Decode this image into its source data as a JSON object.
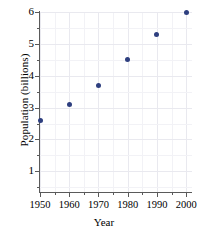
{
  "chart_data": {
    "type": "scatter",
    "title": "",
    "xlabel": "Year",
    "ylabel": "Population (billions)",
    "x": [
      1950,
      1960,
      1970,
      1980,
      1990,
      2000
    ],
    "values": [
      2.6,
      3.1,
      3.7,
      4.5,
      5.3,
      6.0
    ],
    "series": [
      {
        "name": "World population",
        "points": [
          {
            "x": 1950,
            "y": 2.6
          },
          {
            "x": 1960,
            "y": 3.1
          },
          {
            "x": 1970,
            "y": 3.7
          },
          {
            "x": 1980,
            "y": 4.5
          },
          {
            "x": 1990,
            "y": 5.3
          },
          {
            "x": 2000,
            "y": 6.0
          }
        ]
      }
    ],
    "xlim": [
      1950,
      2002
    ],
    "ylim": [
      0.35,
      6.0
    ],
    "xticks": [
      1950,
      1960,
      1970,
      1980,
      1990,
      2000
    ],
    "xtick_labels": [
      "1950",
      "1960",
      "1970",
      "1980",
      "1990",
      "2000"
    ],
    "x_minor_ticks": [
      1955,
      1965,
      1975,
      1985,
      1995
    ],
    "yticks": [
      1,
      2,
      3,
      4,
      5,
      6
    ],
    "ytick_labels": [
      "1",
      "2",
      "3",
      "4",
      "5",
      "6"
    ],
    "y_minor_ticks": [
      0.5,
      1.5,
      2.5,
      3.5,
      4.5,
      5.5
    ],
    "grid": true,
    "legend": "none",
    "marker_color": "#2e3f7f",
    "grid_color": "#e9e9ef",
    "axis_color": "#5a5a5a"
  }
}
